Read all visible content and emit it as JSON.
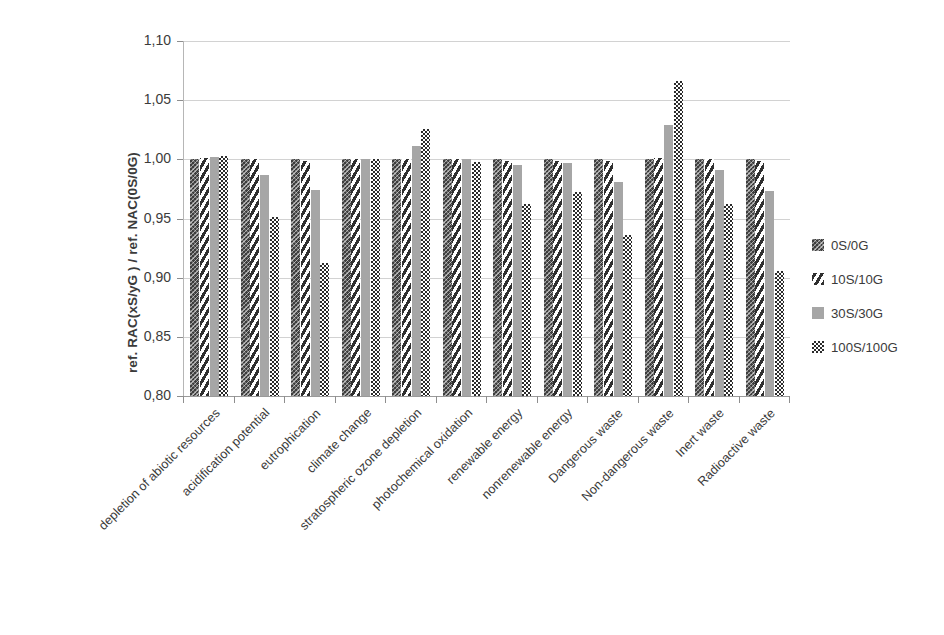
{
  "chart_data": {
    "type": "bar",
    "title": "",
    "xlabel": "",
    "ylabel": "ref. RAC(xS/yG ) /  ref. NAC(0S/0G)",
    "ylim": [
      0.8,
      1.1
    ],
    "ytick_step": 0.05,
    "grid": true,
    "legend_position": "right",
    "ytick_labels": [
      "1,10",
      "1,05",
      "1,00",
      "0,95",
      "0,90",
      "0,85",
      "0,80"
    ],
    "ytick_values": [
      1.1,
      1.05,
      1.0,
      0.95,
      0.9,
      0.85,
      0.8
    ],
    "categories": [
      "depletion of abiotic resources",
      "acidification potential",
      "eutrophication",
      "climate change",
      "stratospheric ozone depletion",
      "photochemical oxidation",
      "renewable energy",
      "nonrenewable energy",
      "Dangerous waste",
      "Non-dangerous waste",
      "Inert waste",
      "Radioactive waste"
    ],
    "series": [
      {
        "name": "0S/0G",
        "pattern": "dark-textured",
        "color": "#3d3d3d",
        "values": [
          1.0,
          1.0,
          1.0,
          1.0,
          1.0,
          1.0,
          1.0,
          1.0,
          1.0,
          1.0,
          1.0,
          1.0
        ]
      },
      {
        "name": "10S/10G",
        "pattern": "diagonal-hatch",
        "color": "#2f2f2f",
        "values": [
          1.001,
          1.0,
          0.999,
          1.0,
          1.0,
          1.0,
          0.999,
          0.999,
          0.999,
          1.001,
          1.0,
          0.999
        ]
      },
      {
        "name": "30S/30G",
        "pattern": "solid-gray",
        "color": "#a6a6a6",
        "values": [
          1.002,
          0.987,
          0.974,
          1.0,
          1.011,
          1.0,
          0.995,
          0.997,
          0.981,
          1.029,
          0.991,
          0.973
        ]
      },
      {
        "name": "100S/100G",
        "pattern": "checkerboard",
        "color": "#2b2b2b",
        "values": [
          1.003,
          0.951,
          0.912,
          1.0,
          1.026,
          0.998,
          0.962,
          0.972,
          0.936,
          1.066,
          0.962,
          0.906
        ]
      }
    ]
  },
  "legend": {
    "items": [
      {
        "label": "0S/0G"
      },
      {
        "label": "10S/10G"
      },
      {
        "label": "30S/30G"
      },
      {
        "label": "100S/100G"
      }
    ]
  }
}
